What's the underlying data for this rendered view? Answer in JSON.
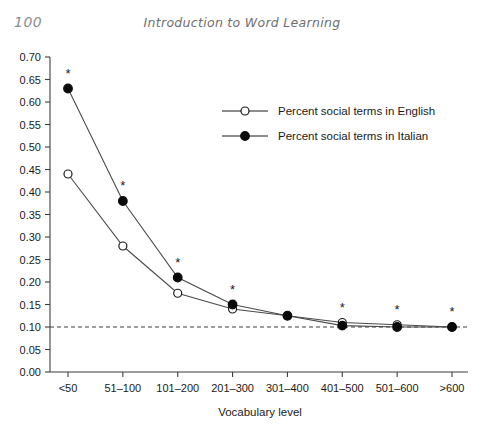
{
  "header": {
    "page_number": "100",
    "running_title": "Introduction to Word Learning"
  },
  "chart_data": {
    "type": "line",
    "title": "",
    "xlabel": "Vocabulary level",
    "ylabel": "",
    "categories": [
      "<50",
      "51–100",
      "101–200",
      "201–300",
      "301–400",
      "401–500",
      "501–600",
      ">600"
    ],
    "series": [
      {
        "name": "Percent social terms in English",
        "marker": "open-circle",
        "values": [
          0.44,
          0.28,
          0.175,
          0.14,
          0.125,
          0.11,
          0.105,
          0.1
        ]
      },
      {
        "name": "Percent social terms in Italian",
        "marker": "filled-circle",
        "values": [
          0.63,
          0.38,
          0.21,
          0.15,
          0.125,
          0.103,
          0.1,
          0.1
        ]
      }
    ],
    "ylim": [
      0.0,
      0.7
    ],
    "ytick_labels": [
      "0.00",
      "0.05",
      "0.10",
      "0.15",
      "0.20",
      "0.25",
      "0.30",
      "0.35",
      "0.40",
      "0.45",
      "0.50",
      "0.55",
      "0.60",
      "0.65",
      "0.70"
    ],
    "ytick_values": [
      0.0,
      0.05,
      0.1,
      0.15,
      0.2,
      0.25,
      0.3,
      0.35,
      0.4,
      0.45,
      0.5,
      0.55,
      0.6,
      0.65,
      0.7
    ],
    "reference_line": {
      "value": 0.1,
      "style": "dashed",
      "label": ""
    },
    "significance_marker": "*",
    "significance_categories": [
      "<50",
      "51–100",
      "101–200",
      "201–300",
      "401–500",
      "501–600",
      ">600"
    ],
    "grid": false,
    "legend_position": "upper-right-inside"
  }
}
